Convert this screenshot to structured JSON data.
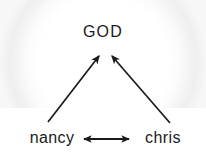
{
  "diagram": {
    "background_color": "#ffffff",
    "ink_color": "#1a1a1a",
    "nodes": [
      {
        "id": "god",
        "label": "GOD",
        "x": 103,
        "y": 35
      },
      {
        "id": "nancy",
        "label": "nancy",
        "x": 52,
        "y": 140
      },
      {
        "id": "chris",
        "label": "chris",
        "x": 168,
        "y": 140
      }
    ],
    "edges": [
      {
        "id": "nancy-to-god",
        "from": "nancy",
        "to": "god",
        "direction": "single",
        "x1": 48,
        "y1": 122,
        "x2": 99,
        "y2": 56
      },
      {
        "id": "chris-to-god",
        "from": "chris",
        "to": "god",
        "direction": "single",
        "x1": 170,
        "y1": 123,
        "x2": 112,
        "y2": 56
      },
      {
        "id": "nancy-chris",
        "from": "nancy",
        "to": "chris",
        "direction": "double",
        "x1": 84,
        "y1": 139,
        "x2": 129,
        "y2": 139
      }
    ]
  }
}
